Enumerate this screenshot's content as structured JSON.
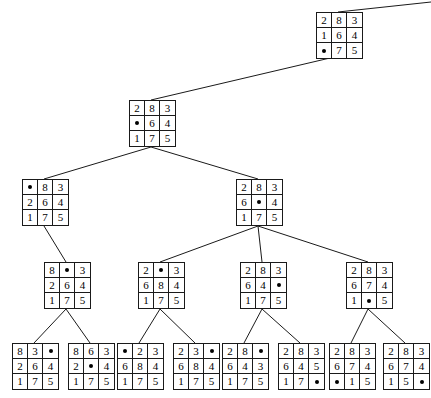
{
  "figure": {
    "blank_glyph": "blank-tile-marker",
    "line_color": "#1a1a1a",
    "background_color": "#ffffff",
    "grid_rows": 3,
    "grid_cols": 3
  },
  "nodes": [
    {
      "id": "n0",
      "level": 0,
      "x": 316,
      "y": 12,
      "tiles": [
        [
          "2",
          "8",
          "3"
        ],
        [
          "1",
          "6",
          "4"
        ],
        [
          "",
          "7",
          "5"
        ]
      ]
    },
    {
      "id": "n1",
      "level": 1,
      "x": 129,
      "y": 100,
      "tiles": [
        [
          "2",
          "8",
          "3"
        ],
        [
          "",
          "6",
          "4"
        ],
        [
          "1",
          "7",
          "5"
        ]
      ]
    },
    {
      "id": "n2",
      "level": 2,
      "x": 22,
      "y": 179,
      "tiles": [
        [
          "",
          "8",
          "3"
        ],
        [
          "2",
          "6",
          "4"
        ],
        [
          "1",
          "7",
          "5"
        ]
      ]
    },
    {
      "id": "n3",
      "level": 2,
      "x": 236,
      "y": 179,
      "tiles": [
        [
          "2",
          "8",
          "3"
        ],
        [
          "6",
          "",
          "4"
        ],
        [
          "1",
          "7",
          "5"
        ]
      ]
    },
    {
      "id": "n4",
      "level": 3,
      "x": 44,
      "y": 262,
      "tiles": [
        [
          "8",
          "",
          "3"
        ],
        [
          "2",
          "6",
          "4"
        ],
        [
          "1",
          "7",
          "5"
        ]
      ]
    },
    {
      "id": "n5",
      "level": 3,
      "x": 138,
      "y": 262,
      "tiles": [
        [
          "2",
          "",
          "3"
        ],
        [
          "6",
          "8",
          "4"
        ],
        [
          "1",
          "7",
          "5"
        ]
      ]
    },
    {
      "id": "n6",
      "level": 3,
      "x": 240,
      "y": 262,
      "tiles": [
        [
          "2",
          "8",
          "3"
        ],
        [
          "6",
          "4",
          ""
        ],
        [
          "1",
          "7",
          "5"
        ]
      ]
    },
    {
      "id": "n7",
      "level": 3,
      "x": 346,
      "y": 262,
      "tiles": [
        [
          "2",
          "8",
          "3"
        ],
        [
          "6",
          "7",
          "4"
        ],
        [
          "1",
          "",
          "5"
        ]
      ]
    },
    {
      "id": "n8",
      "level": 4,
      "x": 12,
      "y": 343,
      "tiles": [
        [
          "8",
          "3",
          ""
        ],
        [
          "2",
          "6",
          "4"
        ],
        [
          "1",
          "7",
          "5"
        ]
      ]
    },
    {
      "id": "n9",
      "level": 4,
      "x": 68,
      "y": 343,
      "tiles": [
        [
          "8",
          "6",
          "3"
        ],
        [
          "2",
          "",
          "4"
        ],
        [
          "1",
          "7",
          "5"
        ]
      ]
    },
    {
      "id": "n10",
      "level": 4,
      "x": 117,
      "y": 343,
      "tiles": [
        [
          "",
          "2",
          "3"
        ],
        [
          "6",
          "8",
          "4"
        ],
        [
          "1",
          "7",
          "5"
        ]
      ]
    },
    {
      "id": "n11",
      "level": 4,
      "x": 173,
      "y": 343,
      "tiles": [
        [
          "2",
          "3",
          ""
        ],
        [
          "6",
          "8",
          "4"
        ],
        [
          "1",
          "7",
          "5"
        ]
      ]
    },
    {
      "id": "n12",
      "level": 4,
      "x": 222,
      "y": 343,
      "tiles": [
        [
          "2",
          "8",
          ""
        ],
        [
          "6",
          "4",
          "3"
        ],
        [
          "1",
          "7",
          "5"
        ]
      ]
    },
    {
      "id": "n13",
      "level": 4,
      "x": 278,
      "y": 343,
      "tiles": [
        [
          "2",
          "8",
          "3"
        ],
        [
          "6",
          "4",
          "5"
        ],
        [
          "1",
          "7",
          ""
        ]
      ]
    },
    {
      "id": "n14",
      "level": 4,
      "x": 329,
      "y": 343,
      "tiles": [
        [
          "2",
          "8",
          "3"
        ],
        [
          "6",
          "7",
          "4"
        ],
        [
          "",
          "1",
          "5"
        ]
      ]
    },
    {
      "id": "n15",
      "level": 4,
      "x": 383,
      "y": 343,
      "tiles": [
        [
          "2",
          "8",
          "3"
        ],
        [
          "6",
          "7",
          "4"
        ],
        [
          "1",
          "5",
          ""
        ]
      ]
    }
  ],
  "edges": [
    {
      "from": "root-incoming",
      "x1": 431,
      "y1": 2,
      "x2": 338,
      "y2": 12
    },
    {
      "from": "n0",
      "to": "n1",
      "x1": 330,
      "y1": 58,
      "x2": 151,
      "y2": 100
    },
    {
      "from": "n1",
      "to": "n2",
      "x1": 151,
      "y1": 147,
      "x2": 44,
      "y2": 179
    },
    {
      "from": "n1",
      "to": "n3",
      "x1": 151,
      "y1": 147,
      "x2": 258,
      "y2": 179
    },
    {
      "from": "n2",
      "to": "n4",
      "x1": 44,
      "y1": 226,
      "x2": 66,
      "y2": 262
    },
    {
      "from": "n3",
      "to": "n5",
      "x1": 258,
      "y1": 226,
      "x2": 160,
      "y2": 262
    },
    {
      "from": "n3",
      "to": "n6",
      "x1": 258,
      "y1": 226,
      "x2": 262,
      "y2": 262
    },
    {
      "from": "n3",
      "to": "n7",
      "x1": 258,
      "y1": 226,
      "x2": 368,
      "y2": 262
    },
    {
      "from": "n4",
      "to": "n8",
      "x1": 66,
      "y1": 309,
      "x2": 34,
      "y2": 343
    },
    {
      "from": "n4",
      "to": "n9",
      "x1": 66,
      "y1": 309,
      "x2": 90,
      "y2": 343
    },
    {
      "from": "n5",
      "to": "n10",
      "x1": 160,
      "y1": 309,
      "x2": 139,
      "y2": 343
    },
    {
      "from": "n5",
      "to": "n11",
      "x1": 160,
      "y1": 309,
      "x2": 195,
      "y2": 343
    },
    {
      "from": "n6",
      "to": "n12",
      "x1": 262,
      "y1": 309,
      "x2": 244,
      "y2": 343
    },
    {
      "from": "n6",
      "to": "n13",
      "x1": 262,
      "y1": 309,
      "x2": 300,
      "y2": 343
    },
    {
      "from": "n7",
      "to": "n14",
      "x1": 368,
      "y1": 309,
      "x2": 351,
      "y2": 343
    },
    {
      "from": "n7",
      "to": "n15",
      "x1": 368,
      "y1": 309,
      "x2": 405,
      "y2": 343
    }
  ]
}
